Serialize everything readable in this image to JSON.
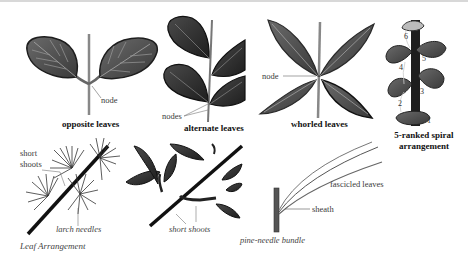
{
  "figure": {
    "caption": "Leaf Arrangement",
    "panels": [
      {
        "id": "opposite",
        "title": "opposite leaves",
        "labels": [
          "node"
        ]
      },
      {
        "id": "alternate",
        "title": "alternate leaves",
        "labels": [
          "nodes"
        ]
      },
      {
        "id": "whorled",
        "title": "whorled leaves",
        "labels": [
          "node"
        ]
      },
      {
        "id": "spiral",
        "title_line1": "5-ranked spiral",
        "title_line2": "arrangement",
        "numbers": [
          "1",
          "2",
          "3",
          "4",
          "5",
          "6"
        ]
      },
      {
        "id": "larch",
        "labels": [
          "short",
          "shoots",
          "larch needles"
        ]
      },
      {
        "id": "short-shoots",
        "labels": [
          "short shoots"
        ]
      },
      {
        "id": "pine",
        "title": "pine-needle bundle",
        "labels": [
          "fascicled leaves",
          "sheath"
        ]
      }
    ]
  },
  "colors": {
    "leaf_fill": "#5a5a5a",
    "leaf_dark": "#2b2b2b",
    "vein": "#9a9a9a",
    "stem": "#7a7a7a",
    "text": "#3a3a3a",
    "title": "#111111"
  }
}
